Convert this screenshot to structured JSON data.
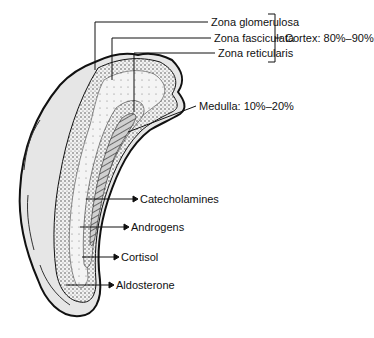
{
  "figure": {
    "colors": {
      "line": "#111111",
      "fill_outer": "#e4e4e4",
      "fill_cortex": "#efefef",
      "fill_medulla": "#bdbdbd"
    }
  },
  "zones": [
    {
      "label": "Zona glomerulosa"
    },
    {
      "label": "Zona fasciculata"
    },
    {
      "label": "Zona reticularis"
    }
  ],
  "cortex_label": "Cortex: 80%–90%",
  "medulla_label": "Medulla: 10%–20%",
  "products": [
    {
      "label": "Catecholamines"
    },
    {
      "label": "Androgens"
    },
    {
      "label": "Cortisol"
    },
    {
      "label": "Aldosterone"
    }
  ]
}
